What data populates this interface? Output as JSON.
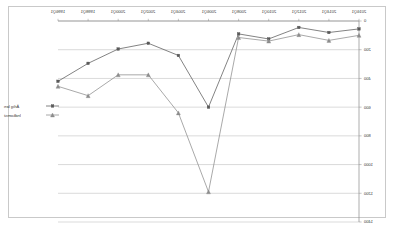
{
  "chart_data": {
    "type": "line",
    "title": "",
    "xlabel": "",
    "ylabel": "",
    "grid": true,
    "legend_position": "middle-left",
    "y_axis_side": "right",
    "y_inverted": true,
    "ylim": [
      0,
      1400
    ],
    "yticks": [
      0,
      200,
      400,
      600,
      800,
      1000,
      1200,
      1400
    ],
    "ytick_labels": [
      "0",
      "200",
      "400",
      "600",
      "800",
      "1000",
      "1200",
      "1400"
    ],
    "categories": [
      "1996Q1",
      "1998Q1",
      "2000Q1",
      "2002Q1",
      "2004Q1",
      "2006Q1",
      "2008Q1",
      "2010Q1",
      "2012Q1",
      "2014Q1",
      "2016Q1"
    ],
    "series": [
      {
        "name": "Årlig løn",
        "marker": "square",
        "color": "#595959",
        "values": [
          420,
          295,
          195,
          155,
          240,
          600,
          90,
          125,
          45,
          80,
          55
        ]
      },
      {
        "name": "Indkomst",
        "marker": "triangle",
        "color": "#8c8c8c",
        "values": [
          455,
          520,
          375,
          375,
          640,
          1190,
          115,
          140,
          95,
          135,
          100
        ]
      }
    ]
  },
  "legend": {
    "entries": [
      {
        "label": "Årlig løn",
        "marker": "square"
      },
      {
        "label": "Indkomst",
        "marker": "triangle"
      }
    ]
  }
}
